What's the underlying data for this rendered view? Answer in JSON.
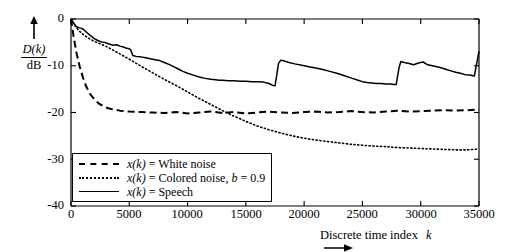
{
  "chart_data": {
    "type": "line",
    "title": "",
    "xlabel": "Discrete time index  k",
    "ylabel": "D(k) / dB",
    "ylabel_numerator": "D(k)",
    "ylabel_denominator": "dB",
    "xlim": [
      0,
      35000
    ],
    "ylim": [
      -40,
      0
    ],
    "xticks": [
      0,
      5000,
      10000,
      15000,
      20000,
      25000,
      30000,
      35000
    ],
    "xticklabels": [
      "0",
      "5000",
      "10000",
      "15000",
      "20000",
      "25000",
      "30000",
      "35000"
    ],
    "yticks": [
      0,
      -10,
      -20,
      -30,
      -40
    ],
    "yticklabels": [
      "0",
      "-10",
      "-20",
      "-30",
      "-40"
    ],
    "grid": false,
    "legend_position": "lower-left-inside",
    "axis_arrows": {
      "x": "right",
      "y": "up"
    },
    "series": [
      {
        "name": "x(k) = White noise",
        "legend_label_prefix": "x(k)",
        "legend_label_rest": " = White noise",
        "style": "dashed",
        "color": "#000000",
        "x": [
          0,
          250,
          500,
          750,
          1000,
          1300,
          1600,
          2000,
          2400,
          2800,
          3200,
          3700,
          4200,
          5000,
          6000,
          7000,
          8000,
          9000,
          10000,
          11000,
          12000,
          13000,
          14000,
          15000,
          16000,
          17000,
          18000,
          19000,
          20000,
          21000,
          22000,
          23000,
          24000,
          25000,
          26000,
          27000,
          28000,
          29000,
          30000,
          31000,
          32000,
          33000,
          34000,
          35000
        ],
        "y": [
          0,
          -4.2,
          -7.6,
          -10.2,
          -12.3,
          -14.4,
          -15.9,
          -17.2,
          -18.1,
          -18.7,
          -19.1,
          -19.4,
          -19.6,
          -19.8,
          -19.9,
          -20.0,
          -20.1,
          -19.9,
          -20.2,
          -20.0,
          -19.8,
          -20.1,
          -19.9,
          -20.2,
          -20.0,
          -19.8,
          -20.0,
          -20.1,
          -19.9,
          -19.8,
          -20.0,
          -19.9,
          -19.7,
          -19.9,
          -20.0,
          -19.8,
          -19.6,
          -19.8,
          -19.7,
          -19.6,
          -19.5,
          -19.6,
          -19.5,
          -19.4
        ]
      },
      {
        "name": "x(k) = Colored noise, b = 0.9",
        "legend_label_prefix": "x(k)",
        "legend_label_rest": " = Colored noise, b = 0.9",
        "style": "dotted",
        "color": "#000000",
        "x": [
          0,
          300,
          700,
          1100,
          1500,
          2000,
          2600,
          3200,
          4000,
          5000,
          6000,
          7000,
          8000,
          9000,
          10000,
          11000,
          12000,
          13000,
          14000,
          15000,
          16000,
          17000,
          18000,
          19000,
          20000,
          21000,
          22000,
          23000,
          24000,
          25000,
          26000,
          27000,
          28000,
          29000,
          30000,
          31000,
          32000,
          33000,
          34000,
          35000
        ],
        "y": [
          0,
          -1.3,
          -2.6,
          -3.4,
          -4.1,
          -4.8,
          -5.4,
          -6.1,
          -7.2,
          -8.6,
          -10.1,
          -11.5,
          -12.9,
          -14.2,
          -15.6,
          -17.0,
          -18.3,
          -19.6,
          -20.8,
          -21.9,
          -22.9,
          -23.7,
          -24.4,
          -25.0,
          -25.5,
          -25.9,
          -26.2,
          -26.5,
          -26.8,
          -27.0,
          -27.2,
          -27.3,
          -27.5,
          -27.6,
          -27.7,
          -27.8,
          -27.9,
          -28.0,
          -28.0,
          -27.8
        ]
      },
      {
        "name": "x(k) = Speech",
        "legend_label_prefix": "x(k)",
        "legend_label_rest": " = Speech",
        "style": "solid",
        "color": "#000000",
        "x": [
          0,
          200,
          450,
          700,
          900,
          1100,
          1400,
          1700,
          2000,
          2300,
          2600,
          2900,
          3200,
          3600,
          3900,
          4200,
          4500,
          4700,
          4900,
          5100,
          5300,
          5600,
          6000,
          6400,
          6800,
          7200,
          7600,
          8000,
          8400,
          8800,
          9200,
          9600,
          10000,
          10500,
          11000,
          11500,
          12000,
          12400,
          12700,
          13000,
          13500,
          14000,
          14500,
          15000,
          15500,
          16000,
          16500,
          17000,
          17300,
          17500,
          17650,
          17800,
          18000,
          18300,
          18700,
          19200,
          19800,
          20400,
          21000,
          21600,
          22200,
          22800,
          23400,
          24000,
          24500,
          25000,
          25400,
          25800,
          26200,
          26600,
          27000,
          27400,
          27700,
          27900,
          28000,
          28150,
          28300,
          28600,
          29000,
          29400,
          29800,
          30200,
          30600,
          31000,
          31400,
          31800,
          32200,
          32600,
          33000,
          33400,
          33800,
          34200,
          34600,
          35000
        ],
        "y": [
          0,
          -0.8,
          -1.6,
          -1.9,
          -2.0,
          -2.3,
          -3.0,
          -3.6,
          -4.2,
          -4.6,
          -4.9,
          -5.0,
          -5.3,
          -5.6,
          -5.5,
          -5.8,
          -6.0,
          -6.2,
          -6.3,
          -6.5,
          -7.8,
          -8.0,
          -8.1,
          -8.3,
          -8.5,
          -8.7,
          -8.9,
          -9.3,
          -9.7,
          -10.2,
          -10.7,
          -11.2,
          -11.6,
          -12.0,
          -12.4,
          -12.7,
          -12.9,
          -13.0,
          -13.1,
          -13.1,
          -13.2,
          -13.2,
          -13.3,
          -13.3,
          -13.4,
          -13.4,
          -13.5,
          -13.8,
          -14.2,
          -14.3,
          -12.0,
          -9.5,
          -8.8,
          -9.0,
          -9.3,
          -9.6,
          -9.9,
          -10.2,
          -10.5,
          -10.8,
          -11.2,
          -11.6,
          -12.1,
          -12.6,
          -13.0,
          -13.4,
          -13.6,
          -13.7,
          -13.8,
          -13.8,
          -13.9,
          -13.9,
          -14.0,
          -14.0,
          -12.5,
          -10.3,
          -9.1,
          -9.3,
          -9.5,
          -9.8,
          -9.4,
          -9.2,
          -9.8,
          -10.0,
          -10.2,
          -10.5,
          -10.8,
          -11.1,
          -11.4,
          -11.6,
          -11.9,
          -12.0,
          -12.2,
          -6.9
        ]
      }
    ]
  },
  "legend": {
    "items": [
      {
        "sample": "dashed",
        "prefix": "x(k)",
        "rest": " = White noise"
      },
      {
        "sample": "dotted",
        "prefix": "x(k)",
        "rest": " = Colored noise, "
      },
      {
        "sample": "solid",
        "prefix": "x(k)",
        "rest": " = Speech"
      }
    ],
    "colored_noise_b_italic": "b",
    "colored_noise_b_value": " = 0.9"
  },
  "axis": {
    "x_caption_main": "Discrete time index",
    "x_caption_var": "k",
    "x_arrow": "⟶",
    "y_caption_num": "D(k)",
    "y_caption_den": "dB"
  }
}
